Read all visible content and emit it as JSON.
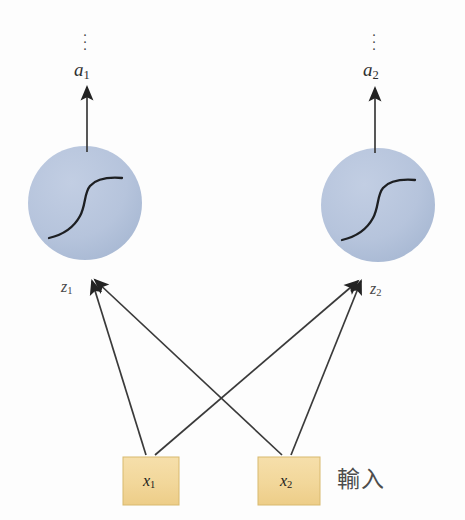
{
  "figure": {
    "background_color": "#fdfdfd",
    "width": 465,
    "height": 520
  },
  "colors": {
    "neuron_fill": "#b6c4dc",
    "neuron_fill_dark": "#a8b8d3",
    "input_fill": "#f2d79a",
    "input_stroke": "#d8b96f",
    "line": "#3a3a3a",
    "text": "#3a3a3a"
  },
  "neurons": [
    {
      "id": "neuron-1",
      "output_label": "a",
      "output_subscript": "1",
      "preactivation_label": "z",
      "preactivation_subscript": "1",
      "activation_glyph": "sigmoid-curve",
      "cx": 85,
      "cy": 203,
      "r": 57
    },
    {
      "id": "neuron-2",
      "output_label": "a",
      "output_subscript": "2",
      "preactivation_label": "z",
      "preactivation_subscript": "2",
      "activation_glyph": "sigmoid-curve",
      "cx": 378,
      "cy": 205,
      "r": 57
    }
  ],
  "inputs": [
    {
      "id": "input-1",
      "label": "x",
      "subscript": "1",
      "x": 123,
      "y": 457,
      "width": 56,
      "height": 48
    },
    {
      "id": "input-2",
      "label": "x",
      "subscript": "2",
      "x": 258,
      "y": 457,
      "width": 62,
      "height": 48
    }
  ],
  "input_layer_caption": "輸入",
  "ellipsis_glyph": "⋮",
  "ellipsis_positions": [
    {
      "x": 85,
      "y": 30
    },
    {
      "x": 374,
      "y": 30
    }
  ],
  "connections": [
    {
      "from": "input-1",
      "to": "neuron-1"
    },
    {
      "from": "input-1",
      "to": "neuron-2"
    },
    {
      "from": "input-2",
      "to": "neuron-1"
    },
    {
      "from": "input-2",
      "to": "neuron-2"
    }
  ],
  "outputs": [
    {
      "from": "neuron-1",
      "label": "a",
      "subscript": "1"
    },
    {
      "from": "neuron-2",
      "label": "a",
      "subscript": "2"
    }
  ]
}
